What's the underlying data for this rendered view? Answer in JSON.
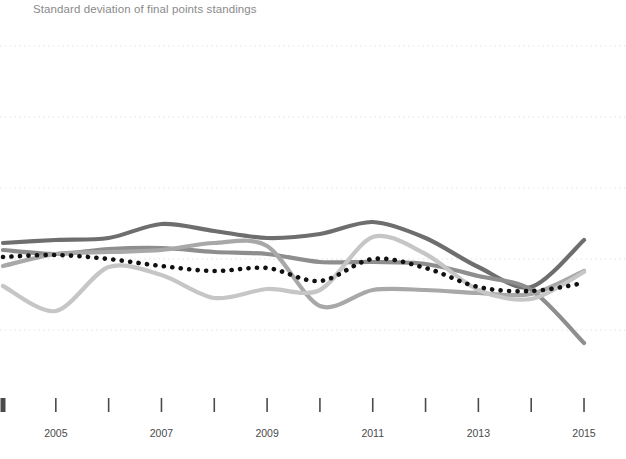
{
  "title": "Standard deviation of final points standings",
  "axis": {
    "x_tick_years": [
      2004,
      2005,
      2006,
      2007,
      2008,
      2009,
      2010,
      2011,
      2012,
      2013,
      2014,
      2015
    ],
    "x_labels": [
      {
        "text": "2005",
        "year": 2005
      },
      {
        "text": "2007",
        "year": 2007
      },
      {
        "text": "2009",
        "year": 2009
      },
      {
        "text": "2011",
        "year": 2011
      },
      {
        "text": "2013",
        "year": 2013
      },
      {
        "text": "2015",
        "year": 2015
      }
    ],
    "gridline_count": 5,
    "grid_style": "dotted",
    "grid_color": "#e3e3e3",
    "tick_color": "#4a4a4a",
    "axis_tick_years_labeled_every": 2
  },
  "colors": {
    "title": "#8a8a8a",
    "series_dark": "#6e6e6e",
    "series_medium": "#8e8e8e",
    "series_mid_light": "#a8a8a8",
    "series_light": "#c6c6c6",
    "series_dotted": "#111111",
    "background": "#ffffff"
  },
  "chart_data": {
    "type": "line",
    "title": "Standard deviation of final points standings",
    "xlabel": "",
    "ylabel": "",
    "x": [
      2004,
      2005,
      2006,
      2007,
      2008,
      2009,
      2010,
      2011,
      2012,
      2013,
      2014,
      2015
    ],
    "xlim": [
      2004,
      2015
    ],
    "ylim_pixels": [
      459,
      0
    ],
    "grid": true,
    "legend": "none",
    "series": [
      {
        "name": "series-1-dark",
        "color": "#6e6e6e",
        "style": "solid",
        "values_px": [
          243,
          240,
          238,
          224,
          231,
          238,
          234,
          222,
          238,
          267,
          287,
          240
        ]
      },
      {
        "name": "series-2-medium",
        "color": "#8e8e8e",
        "style": "solid",
        "values_px": [
          250,
          254,
          249,
          248,
          252,
          254,
          262,
          262,
          264,
          276,
          290,
          343
        ]
      },
      {
        "name": "series-3-mid-light",
        "color": "#a8a8a8",
        "style": "solid",
        "values_px": [
          266,
          254,
          252,
          250,
          243,
          246,
          306,
          290,
          290,
          293,
          294,
          271
        ]
      },
      {
        "name": "series-4-light",
        "color": "#c6c6c6",
        "style": "solid",
        "values_px": [
          286,
          311,
          267,
          275,
          298,
          289,
          290,
          237,
          254,
          290,
          299,
          272
        ]
      },
      {
        "name": "series-5-dotted",
        "color": "#111111",
        "style": "dotted",
        "values_px": [
          257,
          255,
          259,
          266,
          271,
          268,
          281,
          259,
          268,
          287,
          291,
          283
        ]
      }
    ]
  }
}
